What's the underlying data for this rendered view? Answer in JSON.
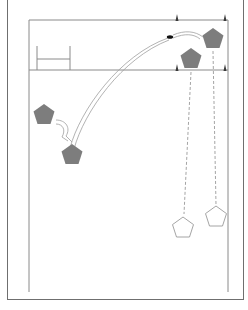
{
  "diagram": {
    "type": "rugby-drill",
    "colors": {
      "field_line": "#8a8a8a",
      "frame": "#6f6f6f",
      "attacker_fill": "#7d7d7d",
      "defender_stroke": "#9a9a9a",
      "cone": "#3a3a3a",
      "ball": "#111111",
      "pass_line": "#9a9a9a"
    },
    "players": [
      {
        "id": "p1",
        "team": "attack",
        "label": "",
        "x": 213,
        "y": 39
      },
      {
        "id": "p2",
        "team": "attack",
        "label": "",
        "x": 191,
        "y": 59
      },
      {
        "id": "p3",
        "team": "attack",
        "label": "",
        "x": 44,
        "y": 115
      },
      {
        "id": "p4",
        "team": "attack",
        "label": "",
        "x": 72,
        "y": 155
      },
      {
        "id": "p5",
        "team": "defense",
        "label": "",
        "x": 183,
        "y": 228
      },
      {
        "id": "p6",
        "team": "defense",
        "label": "",
        "x": 216,
        "y": 217
      }
    ],
    "cones": [
      {
        "x": 177,
        "y": 20
      },
      {
        "x": 225,
        "y": 20
      },
      {
        "x": 177,
        "y": 70
      },
      {
        "x": 225,
        "y": 70
      }
    ],
    "ball": {
      "x": 170,
      "y": 37
    }
  }
}
